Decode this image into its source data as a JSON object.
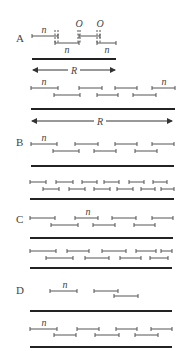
{
  "figure": {
    "panels": [
      {
        "label": "A",
        "label_pos": [
          16,
          42
        ],
        "segments": [
          {
            "x1": 32,
            "x2": 58,
            "y": 36
          },
          {
            "x1": 55,
            "x2": 79,
            "y": 43
          },
          {
            "x1": 79,
            "x2": 100,
            "y": 36
          },
          {
            "x1": 97,
            "x2": 116,
            "y": 43
          }
        ],
        "dashed_ticks": [
          {
            "x": 55,
            "y1": 30,
            "y2": 44
          },
          {
            "x": 58,
            "y1": 30,
            "y2": 44
          },
          {
            "x": 78,
            "y1": 30,
            "y2": 44
          },
          {
            "x": 80,
            "y1": 30,
            "y2": 44
          },
          {
            "x": 97,
            "y1": 30,
            "y2": 44
          },
          {
            "x": 100,
            "y1": 30,
            "y2": 44
          }
        ],
        "texts": [
          {
            "t": "n",
            "x": 44,
            "y": 33,
            "cls": "ital"
          },
          {
            "t": "n",
            "x": 67,
            "y": 53,
            "cls": "ital"
          },
          {
            "t": "n",
            "x": 107,
            "y": 53,
            "cls": "ital"
          },
          {
            "t": "O",
            "x": 79,
            "y": 27,
            "cls": "ital"
          },
          {
            "t": "O",
            "x": 100,
            "y": 27,
            "cls": "ital"
          }
        ],
        "bars": [
          {
            "x1": 32,
            "x2": 116,
            "y": 59
          }
        ],
        "arrows": [
          {
            "x1": 32,
            "x2": 116,
            "y": 70,
            "label": "R",
            "lx": 74
          }
        ]
      },
      {
        "label": "",
        "segments": [
          {
            "x1": 31,
            "x2": 58,
            "y": 88
          },
          {
            "x1": 79,
            "x2": 102,
            "y": 88
          },
          {
            "x1": 115,
            "x2": 137,
            "y": 88
          },
          {
            "x1": 152,
            "x2": 175,
            "y": 88
          },
          {
            "x1": 54,
            "x2": 80,
            "y": 95
          },
          {
            "x1": 97,
            "x2": 118,
            "y": 95
          },
          {
            "x1": 133,
            "x2": 156,
            "y": 95
          }
        ],
        "texts": [
          {
            "t": "n",
            "x": 44,
            "y": 85,
            "cls": "ital"
          },
          {
            "t": "n",
            "x": 164,
            "y": 85,
            "cls": "ital"
          }
        ],
        "bars": [
          {
            "x1": 31,
            "x2": 175,
            "y": 109
          }
        ],
        "arrows": [
          {
            "x1": 31,
            "x2": 173,
            "y": 121,
            "label": "R",
            "lx": 100
          }
        ]
      },
      {
        "label": "B",
        "label_pos": [
          16,
          146
        ],
        "segments": [
          {
            "x1": 31,
            "x2": 57,
            "y": 144
          },
          {
            "x1": 75,
            "x2": 98,
            "y": 144
          },
          {
            "x1": 115,
            "x2": 137,
            "y": 144
          },
          {
            "x1": 152,
            "x2": 174,
            "y": 144
          },
          {
            "x1": 53,
            "x2": 79,
            "y": 151
          },
          {
            "x1": 94,
            "x2": 116,
            "y": 151
          },
          {
            "x1": 135,
            "x2": 157,
            "y": 151
          }
        ],
        "texts": [
          {
            "t": "n",
            "x": 44,
            "y": 141,
            "cls": "ital"
          }
        ],
        "bars": [
          {
            "x1": 31,
            "x2": 174,
            "y": 166
          }
        ]
      },
      {
        "label": "",
        "segments": [
          {
            "x1": 30,
            "x2": 46,
            "y": 182
          },
          {
            "x1": 56,
            "x2": 73,
            "y": 182
          },
          {
            "x1": 82,
            "x2": 97,
            "y": 182
          },
          {
            "x1": 104,
            "x2": 119,
            "y": 182
          },
          {
            "x1": 129,
            "x2": 144,
            "y": 182
          },
          {
            "x1": 153,
            "x2": 167,
            "y": 182
          },
          {
            "x1": 43,
            "x2": 59,
            "y": 189
          },
          {
            "x1": 69,
            "x2": 85,
            "y": 189
          },
          {
            "x1": 94,
            "x2": 110,
            "y": 189
          },
          {
            "x1": 117,
            "x2": 133,
            "y": 189
          },
          {
            "x1": 141,
            "x2": 155,
            "y": 189
          },
          {
            "x1": 161,
            "x2": 174,
            "y": 189
          }
        ],
        "texts": [],
        "bars": [
          {
            "x1": 30,
            "x2": 174,
            "y": 199
          }
        ]
      },
      {
        "label": "C",
        "label_pos": [
          16,
          223
        ],
        "segments": [
          {
            "x1": 30,
            "x2": 55,
            "y": 218
          },
          {
            "x1": 75,
            "x2": 98,
            "y": 218
          },
          {
            "x1": 112,
            "x2": 136,
            "y": 218
          },
          {
            "x1": 152,
            "x2": 173,
            "y": 218
          },
          {
            "x1": 51,
            "x2": 78,
            "y": 225
          },
          {
            "x1": 93,
            "x2": 115,
            "y": 225
          },
          {
            "x1": 134,
            "x2": 155,
            "y": 225
          }
        ],
        "texts": [
          {
            "t": "n",
            "x": 88,
            "y": 215,
            "cls": "ital"
          }
        ],
        "bars": [
          {
            "x1": 30,
            "x2": 173,
            "y": 238
          }
        ]
      },
      {
        "label": "",
        "segments": [
          {
            "x1": 30,
            "x2": 56,
            "y": 251
          },
          {
            "x1": 67,
            "x2": 89,
            "y": 251
          },
          {
            "x1": 102,
            "x2": 126,
            "y": 251
          },
          {
            "x1": 136,
            "x2": 156,
            "y": 251
          },
          {
            "x1": 161,
            "x2": 172,
            "y": 251
          },
          {
            "x1": 46,
            "x2": 73,
            "y": 258
          },
          {
            "x1": 85,
            "x2": 109,
            "y": 258
          },
          {
            "x1": 120,
            "x2": 141,
            "y": 258
          },
          {
            "x1": 150,
            "x2": 168,
            "y": 258
          }
        ],
        "texts": [],
        "bars": [
          {
            "x1": 30,
            "x2": 172,
            "y": 268
          }
        ]
      },
      {
        "label": "D",
        "label_pos": [
          16,
          294
        ],
        "segments": [
          {
            "x1": 50,
            "x2": 77,
            "y": 291
          },
          {
            "x1": 94,
            "x2": 118,
            "y": 291
          },
          {
            "x1": 114,
            "x2": 138,
            "y": 296
          }
        ],
        "texts": [
          {
            "t": "n",
            "x": 65,
            "y": 288,
            "cls": "ital"
          }
        ],
        "bars": [
          {
            "x1": 30,
            "x2": 172,
            "y": 311
          }
        ]
      },
      {
        "label": "",
        "segments": [
          {
            "x1": 30,
            "x2": 57,
            "y": 329
          },
          {
            "x1": 77,
            "x2": 99,
            "y": 329
          },
          {
            "x1": 116,
            "x2": 137,
            "y": 329
          },
          {
            "x1": 151,
            "x2": 172,
            "y": 329
          },
          {
            "x1": 54,
            "x2": 76,
            "y": 335
          },
          {
            "x1": 95,
            "x2": 119,
            "y": 335
          },
          {
            "x1": 135,
            "x2": 158,
            "y": 335
          }
        ],
        "texts": [
          {
            "t": "n",
            "x": 44,
            "y": 326,
            "cls": "ital"
          }
        ],
        "bars": [
          {
            "x1": 30,
            "x2": 172,
            "y": 347
          }
        ]
      }
    ],
    "colors": {
      "segment": "#555555",
      "bar": "#222222",
      "text": "#444444"
    }
  }
}
